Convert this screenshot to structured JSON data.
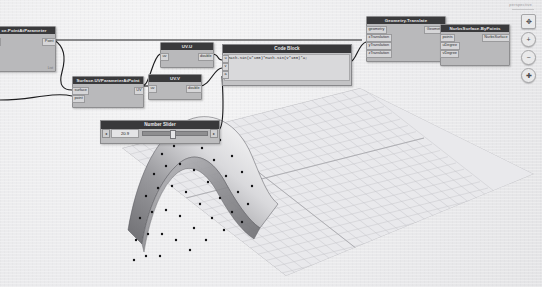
{
  "app": {
    "workspace_name": "Dynamo Graph Canvas",
    "view_label": "perspective"
  },
  "nodes": [
    {
      "id": "surface-point-at-parameter",
      "title": "ce.PointAtParameter",
      "full_title": "Surface.PointAtParameter",
      "inputs": [
        "uv"
      ],
      "outputs": [
        "Point"
      ],
      "footer": "List",
      "x": -8,
      "y": 26,
      "w": 62,
      "h": 44
    },
    {
      "id": "surface-uvparameter-at-point",
      "title": "Surface.UVParameterAtPoint",
      "inputs": [
        "surface",
        "point"
      ],
      "outputs": [
        "UV"
      ],
      "footer": "",
      "x": 72,
      "y": 76,
      "w": 70,
      "h": 30
    },
    {
      "id": "uv-u",
      "title": "UV.U",
      "inputs": [
        "uv"
      ],
      "outputs": [
        "double"
      ],
      "footer": "",
      "x": 160,
      "y": 42,
      "w": 52,
      "h": 24
    },
    {
      "id": "uv-v",
      "title": "UV.V",
      "inputs": [
        "uv"
      ],
      "outputs": [
        "double"
      ],
      "footer": "",
      "x": 148,
      "y": 74,
      "w": 52,
      "h": 24
    },
    {
      "id": "geometry-translate",
      "title": "Geometry.Translate",
      "inputs": [
        "geometry",
        "xTranslation",
        "yTranslation",
        "zTranslation"
      ],
      "outputs": [
        "Geometry"
      ],
      "footer": "",
      "x": 366,
      "y": 16,
      "w": 78,
      "h": 44
    },
    {
      "id": "nurbssurface-bypoints",
      "title": "NurbsSurface.ByPoints",
      "inputs": [
        "points",
        "uDegree",
        "vDegree"
      ],
      "outputs": [
        "NurbsSurface"
      ],
      "footer": "",
      "x": 440,
      "y": 24,
      "w": 68,
      "h": 40
    }
  ],
  "code_block": {
    "title": "Code Block",
    "line1": "Math.Sin(u*100)*Math.Sin(v*100)*a;",
    "line2": "",
    "inputs": [
      "u",
      "v",
      "a"
    ],
    "x": 222,
    "y": 44,
    "w": 128,
    "h": 40
  },
  "number_slider": {
    "title": "Number Slider",
    "value": "20.9",
    "decrement_label": "◂",
    "increment_label": "▸",
    "x": 100,
    "y": 120,
    "w": 118,
    "h": 22
  },
  "nav_toolbar": {
    "buttons": [
      {
        "name": "fit-to-screen-button",
        "glyph": "✥"
      },
      {
        "name": "zoom-in-button",
        "glyph": "+"
      },
      {
        "name": "zoom-out-button",
        "glyph": "−"
      },
      {
        "name": "pan-button",
        "glyph": "✚"
      }
    ]
  },
  "preview": {
    "label": "3D Geometry Preview",
    "surface_name": "nurbs-surface",
    "grid_name": "ground-grid"
  },
  "colors": {
    "node_header": "#3a3a3c",
    "node_body": "#b9b9bb",
    "port": "#d6d6d8",
    "wire": "#1a1a1c",
    "background": "#eaeaec",
    "surface_light": "#f2f2f3",
    "surface_dark": "#6e6e72"
  }
}
